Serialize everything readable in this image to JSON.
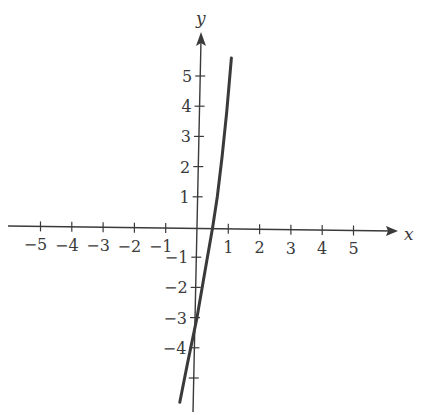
{
  "chart_data": {
    "type": "line",
    "title": "",
    "xlabel": "x",
    "ylabel": "y",
    "xlim": [
      -6,
      6.5
    ],
    "ylim": [
      -6,
      6
    ],
    "grid": false,
    "legend": null,
    "x_ticks": [
      -5,
      -4,
      -3,
      -2,
      -1,
      1,
      2,
      3,
      4,
      5
    ],
    "x_tick_labels": [
      "−5",
      "−4",
      "−3",
      "−2",
      "−1",
      "1",
      "2",
      "3",
      "4",
      "5"
    ],
    "y_ticks": [
      5,
      4,
      3,
      2,
      1,
      -1,
      -2,
      -3,
      -4,
      -5
    ],
    "y_tick_labels": [
      "5",
      "4",
      "3",
      "2",
      "1",
      "−1",
      "−2",
      "−3",
      "−4",
      ""
    ],
    "series": [
      {
        "name": "curve",
        "x": [
          -0.55,
          -0.3,
          0.0,
          0.25,
          0.5,
          0.65,
          0.8,
          0.95,
          1.1
        ],
        "y": [
          -5.8,
          -4.5,
          -3.0,
          -1.5,
          0.0,
          1.0,
          2.3,
          3.8,
          5.6
        ],
        "color": "#3a3a3a"
      }
    ],
    "annotations": [
      {
        "text": "x",
        "position": "end of x-axis"
      },
      {
        "text": "y",
        "position": "top of y-axis"
      }
    ]
  }
}
